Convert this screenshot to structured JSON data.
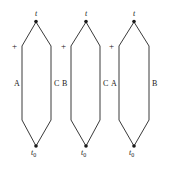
{
  "figure": {
    "type": "diagram",
    "background_color": "#ffffff",
    "line_color": "#3a3a3a",
    "text_color": "#1a1a1a",
    "width": 169,
    "height": 169,
    "shapes": [
      {
        "id": "shape-1",
        "apex_x": 36,
        "left_x": 22,
        "right_x": 51,
        "top_label": "t",
        "bottom_label_base": "t",
        "bottom_label_sub": "0",
        "plus_label": "+",
        "left_side_label": "A",
        "right_side_label": "C"
      },
      {
        "id": "shape-2",
        "apex_x": 86,
        "left_x": 71,
        "right_x": 100,
        "top_label": "t",
        "bottom_label_base": "t",
        "bottom_label_sub": "0",
        "plus_label": "+",
        "left_side_label": "B",
        "right_side_label": "C"
      },
      {
        "id": "shape-3",
        "apex_x": 134,
        "left_x": 119,
        "right_x": 149,
        "top_label": "t",
        "bottom_label_base": "t",
        "bottom_label_sub": "0",
        "plus_label": "+",
        "left_side_label": "A",
        "right_side_label": "B"
      }
    ],
    "geometry": {
      "top_vertex_y": 22,
      "upper_shoulder_y": 46,
      "lower_shoulder_y": 120,
      "bottom_vertex_y": 146,
      "top_label_y": 11,
      "bottom_label_y": 149,
      "plus_label_y": 43,
      "side_label_y": 81
    }
  }
}
